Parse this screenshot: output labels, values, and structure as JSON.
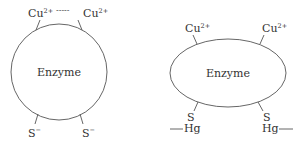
{
  "diagram": {
    "left": {
      "shape": "circle",
      "center_label": "Enzyme",
      "top_left": {
        "base": "Cu",
        "charge": "2+"
      },
      "top_right": {
        "base": "Cu",
        "charge": "2+"
      },
      "top_link": "-----",
      "bottom_left": {
        "base": "S",
        "charge": "−"
      },
      "bottom_right": {
        "base": "S",
        "charge": "−"
      }
    },
    "right": {
      "shape": "ellipse",
      "center_label": "Enzyme",
      "top_left": {
        "base": "Cu",
        "charge": "2+"
      },
      "top_right": {
        "base": "Cu",
        "charge": "2+"
      },
      "bottom_left": {
        "s": "S",
        "hg": "Hg"
      },
      "bottom_right": {
        "s": "S",
        "hg": "Hg"
      }
    },
    "colors": {
      "line": "#555555",
      "text": "#333333",
      "background": "#ffffff"
    }
  }
}
